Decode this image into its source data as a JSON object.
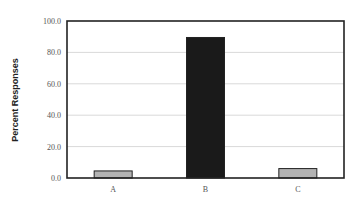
{
  "chart_data": {
    "type": "bar",
    "title": "",
    "xlabel": "",
    "ylabel": "Percent Responses",
    "categories": [
      "A",
      "B",
      "C"
    ],
    "values": [
      4.5,
      89.5,
      6.0
    ],
    "bar_colors": [
      "#b3b3b3",
      "#1a1a1a",
      "#b3b3b3"
    ],
    "ylim": [
      0,
      100
    ],
    "yticks": [
      0,
      20,
      40,
      60,
      80,
      100
    ],
    "ytick_labels": [
      "0.0",
      "20.0",
      "40.0",
      "60.0",
      "80.0",
      "100.0"
    ],
    "grid": true,
    "legend": null
  }
}
